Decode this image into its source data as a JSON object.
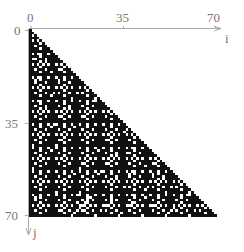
{
  "chart_data": {
    "type": "heatmap",
    "title": "",
    "xlabel": "i",
    "ylabel": "j",
    "x_ticks": [
      "0",
      "35",
      "70"
    ],
    "y_ticks": [
      "0",
      "35",
      "70"
    ],
    "x_range": [
      0,
      71
    ],
    "y_range": [
      0,
      71
    ],
    "rows": 72,
    "cols": 72,
    "structure": "lower-triangular (cells with i <= j filled)",
    "colors": {
      "on": "#111111",
      "off": "#ffffff",
      "axis": "#aaaaaa",
      "text": "#777777"
    },
    "grid": false,
    "legend": null
  },
  "axes": {
    "x": {
      "label": "i",
      "ticks": [
        {
          "value": 0,
          "label": "0"
        },
        {
          "value": 35,
          "label": "35"
        },
        {
          "value": 70,
          "label": "70"
        }
      ]
    },
    "y": {
      "label": "j",
      "ticks": [
        {
          "value": 0,
          "label": "0"
        },
        {
          "value": 35,
          "label": "35"
        },
        {
          "value": 70,
          "label": "70"
        }
      ]
    }
  }
}
